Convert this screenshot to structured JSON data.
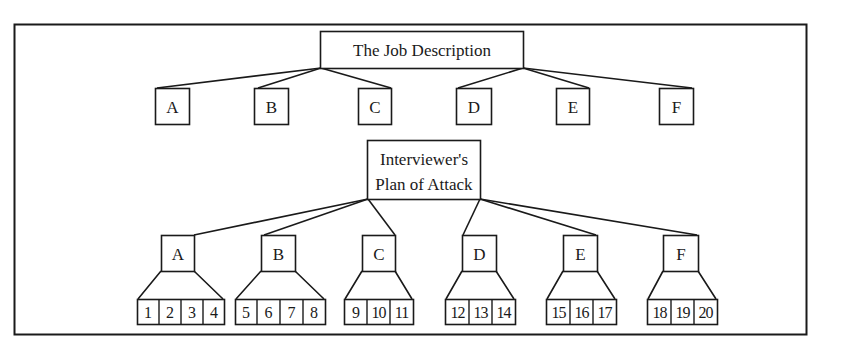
{
  "diagram": {
    "type": "hierarchy",
    "colors": {
      "line": "#1a1a1a",
      "background": "#ffffff"
    },
    "top_node": {
      "label": "The Job Description"
    },
    "top_children": [
      {
        "label": "A"
      },
      {
        "label": "B"
      },
      {
        "label": "C"
      },
      {
        "label": "D"
      },
      {
        "label": "E"
      },
      {
        "label": "F"
      }
    ],
    "middle_node": {
      "line1": "Interviewer's",
      "line2": "Plan of Attack"
    },
    "plan_children": [
      {
        "label": "A",
        "items": [
          "1",
          "2",
          "3",
          "4"
        ]
      },
      {
        "label": "B",
        "items": [
          "5",
          "6",
          "7",
          "8"
        ]
      },
      {
        "label": "C",
        "items": [
          "9",
          "10",
          "11"
        ]
      },
      {
        "label": "D",
        "items": [
          "12",
          "13",
          "14"
        ]
      },
      {
        "label": "E",
        "items": [
          "15",
          "16",
          "17"
        ]
      },
      {
        "label": "F",
        "items": [
          "18",
          "19",
          "20"
        ]
      }
    ]
  }
}
